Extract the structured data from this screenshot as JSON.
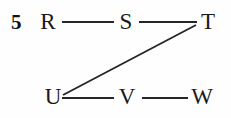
{
  "figure": {
    "number_label": "5",
    "background_color": "#fefefe",
    "ink_color": "#1a1a1a",
    "edge_color": "#262626",
    "width": 231,
    "height": 118
  },
  "graph": {
    "nodes": [
      {
        "id": "R",
        "label": "R",
        "x": 48,
        "y": 22,
        "row": "top"
      },
      {
        "id": "S",
        "label": "S",
        "x": 126,
        "y": 22,
        "row": "top"
      },
      {
        "id": "T",
        "label": "T",
        "x": 208,
        "y": 22,
        "row": "top"
      },
      {
        "id": "U",
        "label": "U",
        "x": 53,
        "y": 97,
        "row": "bottom"
      },
      {
        "id": "V",
        "label": "V",
        "x": 127,
        "y": 97,
        "row": "bottom"
      },
      {
        "id": "W",
        "label": "W",
        "x": 202,
        "y": 97,
        "row": "bottom"
      }
    ],
    "edges": [
      {
        "from": "R",
        "to": "S",
        "x1": 62,
        "y1": 22,
        "x2": 114,
        "y2": 22
      },
      {
        "from": "S",
        "to": "T",
        "x1": 139,
        "y1": 22,
        "x2": 197,
        "y2": 22
      },
      {
        "from": "T",
        "to": "U",
        "x1": 196,
        "y1": 25,
        "x2": 63,
        "y2": 95
      },
      {
        "from": "U",
        "to": "V",
        "x1": 62,
        "y1": 98,
        "x2": 114,
        "y2": 98
      },
      {
        "from": "V",
        "to": "W",
        "x1": 142,
        "y1": 98,
        "x2": 188,
        "y2": 98
      }
    ]
  }
}
